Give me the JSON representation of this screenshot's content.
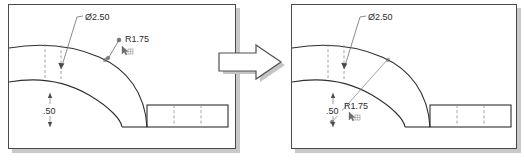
{
  "figure": {
    "type": "cad-dimension-drag-comparison",
    "panel_count": 2
  },
  "before_panel": {
    "name": "before",
    "annotations": {
      "diameter_label": "Ø2.50",
      "radius_label": "R1.75",
      "thickness_label": ".50",
      "arc_marker_glyph": "Ø",
      "cursor_glyph": "⌖"
    }
  },
  "after_panel": {
    "name": "after",
    "annotations": {
      "diameter_label": "Ø2.50",
      "radius_label": "R1.75",
      "thickness_label": ".50",
      "arc_marker_glyph": "Ø",
      "cursor_glyph": "⌖"
    }
  },
  "transform_arrow": {
    "direction": "right",
    "label": ""
  },
  "colors": {
    "panel_border": "#4a4a4a",
    "panel_shadow": "#c9c9c9",
    "part_outline": "#2f2f2f",
    "hidden_line": "#9a9a9a",
    "dimension_line": "#8c8c8c",
    "text": "#2b2b2b",
    "background": "#ffffff"
  }
}
